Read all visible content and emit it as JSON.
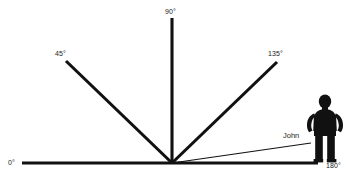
{
  "diagram": {
    "background_color": "#ffffff",
    "line_color": "#111111",
    "text_color": "#1a1a1a",
    "vertex": {
      "x": 172,
      "y": 163
    },
    "rays": [
      {
        "id": "ray-0",
        "label": "0°",
        "angle_degrees": 0,
        "weight": "thick",
        "label_x": 8,
        "label_y": 165,
        "x1": 22,
        "y1": 163,
        "x2": 172,
        "y2": 163
      },
      {
        "id": "ray-45",
        "label": "45°",
        "angle_degrees": 45,
        "weight": "thick",
        "label_x": 55,
        "label_y": 56,
        "x1": 66,
        "y1": 61,
        "x2": 172,
        "y2": 163
      },
      {
        "id": "ray-90",
        "label": "90°",
        "angle_degrees": 90,
        "weight": "thick",
        "label_x": 165,
        "label_y": 14,
        "x1": 172,
        "y1": 18,
        "x2": 172,
        "y2": 163
      },
      {
        "id": "ray-135",
        "label": "135°",
        "angle_degrees": 135,
        "weight": "thick",
        "label_x": 268,
        "label_y": 56,
        "x1": 277,
        "y1": 62,
        "x2": 172,
        "y2": 163
      },
      {
        "id": "ray-180",
        "label": "180°",
        "angle_degrees": 180,
        "weight": "thick",
        "label_x": 326,
        "label_y": 168,
        "x1": 172,
        "y1": 163,
        "x2": 318,
        "y2": 163
      }
    ],
    "pointer_ray": {
      "id": "ray-john",
      "label": "John",
      "weight": "thin",
      "label_x": 283,
      "label_y": 138,
      "x1": 172,
      "y1": 163,
      "x2": 311,
      "y2": 143
    },
    "figure": {
      "id": "person-john",
      "name": "John",
      "pose": "standing-hands-on-hips",
      "x": 306,
      "y": 95,
      "width": 38,
      "height": 68
    }
  }
}
